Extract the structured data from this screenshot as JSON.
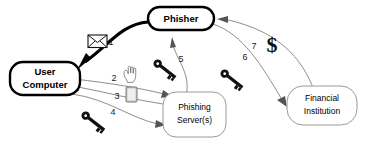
{
  "diagram": {
    "background_color": "#ffffff",
    "nodes": [
      {
        "id": "phisher",
        "label_line1": "Phisher",
        "label_line2": "",
        "style": "bold-rounded"
      },
      {
        "id": "user",
        "label_line1": "User",
        "label_line2": "Computer",
        "style": "bold-rounded"
      },
      {
        "id": "server",
        "label_line1": "Phishing",
        "label_line2": "Server(s)",
        "style": "thin-rounded"
      },
      {
        "id": "bank",
        "label_line1": "Financial",
        "label_line2": "Institution",
        "style": "thin-rounded"
      }
    ],
    "edges": [
      {
        "step": "1",
        "from": "phisher",
        "to": "user",
        "emphasis": "bold",
        "icon": "envelope-icon"
      },
      {
        "step": "2",
        "from": "user",
        "to": "server",
        "emphasis": "thin",
        "icon": "hand-cursor-icon"
      },
      {
        "step": "3",
        "from": "server",
        "to": "user",
        "emphasis": "thin",
        "icon": "document-icon"
      },
      {
        "step": "4",
        "from": "user",
        "to": "server",
        "emphasis": "thin",
        "icon": "key-icon"
      },
      {
        "step": "5",
        "from": "server",
        "to": "phisher",
        "emphasis": "thin",
        "icon": "key-icon"
      },
      {
        "step": "6",
        "from": "phisher",
        "to": "bank",
        "emphasis": "thin",
        "icon": "key-icon"
      },
      {
        "step": "7",
        "from": "bank",
        "to": "phisher",
        "emphasis": "thin",
        "icon": "dollar-icon"
      }
    ],
    "step_labels": [
      "1",
      "2",
      "3",
      "4",
      "5",
      "6",
      "7"
    ],
    "dollar_symbol": "$",
    "colors": {
      "stroke_bold": "#000000",
      "stroke_thin": "#8e8e8e",
      "node_fill": "#ffffff",
      "key_fill": "#111111",
      "document_fill": "#c9c9c9"
    }
  }
}
